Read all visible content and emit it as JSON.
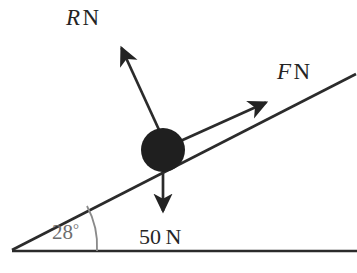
{
  "diagram": {
    "background_color": "#ffffff",
    "line_color": "#2b2b2b",
    "arc_color": "#8a8a8a",
    "angle_text_color": "#6e6e6e",
    "ball_color": "#1f1f1f",
    "incline": {
      "angle_label_value": "28",
      "angle_label_degree": "°",
      "apex_x": 12,
      "apex_y": 250,
      "top_x": 356,
      "top_y": 74
    },
    "base_line": {
      "start_x": 12,
      "start_y": 251,
      "end_x": 357,
      "end_y": 251
    },
    "particle": {
      "center_x": 163,
      "center_y": 150,
      "radius": 22
    },
    "forces": [
      {
        "id": "normal-force",
        "symbol": "R",
        "unit": "N",
        "label": "R N",
        "direction": "up-left perpendicular to incline",
        "start_x": 160,
        "start_y": 132,
        "tip_x": 117,
        "tip_y": 40
      },
      {
        "id": "applied-force",
        "symbol": "F",
        "unit": "N",
        "label": "F N",
        "direction": "up-right parallel to incline",
        "start_x": 176,
        "start_y": 143,
        "tip_x": 274,
        "tip_y": 99
      },
      {
        "id": "weight-force",
        "symbol": "50",
        "unit": "N",
        "label": "50 N",
        "direction": "vertically downward",
        "start_x": 163,
        "start_y": 165,
        "tip_x": 163,
        "tip_y": 220
      }
    ]
  }
}
